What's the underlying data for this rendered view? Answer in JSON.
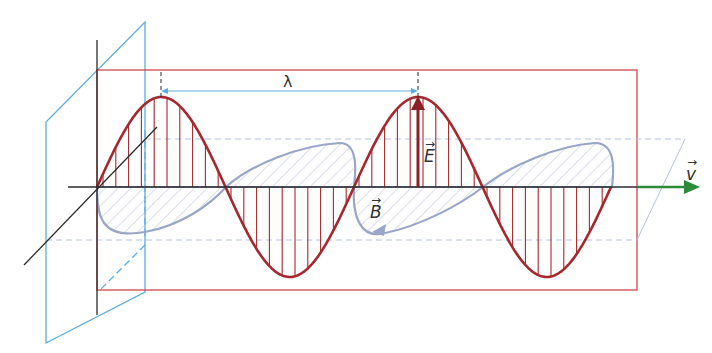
{
  "diagram": {
    "labels": {
      "wavelength": "λ",
      "electric_field": "E",
      "magnetic_field": "B",
      "velocity": "v",
      "vector_arrow": "→"
    },
    "colors": {
      "electric_wave": "#a5282e",
      "magnetic_wave": "#9aa6c8",
      "plane": "#5aaee0",
      "axis": "#2b2b2b",
      "frame": "#d0454a",
      "velocity_arrow": "#2e8b3a",
      "dimension_line": "#5aaee0"
    },
    "geometry": {
      "axis_y": 187,
      "wave_start_x": 97,
      "wavelength_px": 257,
      "e_amplitude_px": 90,
      "b_amplitude_px": 50
    }
  }
}
